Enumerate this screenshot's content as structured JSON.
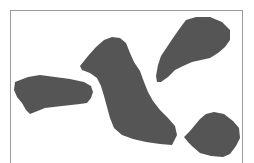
{
  "figure": {
    "frame": {
      "stroke": "#9a9a9a",
      "x": 10,
      "y": 10,
      "width": 233
    },
    "fill_color": "#555555",
    "background_color": "#ffffff",
    "blobs": [
      {
        "id": "left",
        "points": "15,82 28,77 40,75 55,77 70,79 84,82 91,86 93,92 91,98 87,103 80,104 62,106 45,108 30,114 26,110 22,103 17,97 14,90"
      },
      {
        "id": "center",
        "points": "80,66 88,56 96,47 104,40 112,37 120,38 126,43 130,53 134,62 140,71 144,82 148,92 153,101 160,110 168,118 175,126 177,135 172,145 160,144 146,142 133,139 122,135 114,128 110,118 107,107 104,96 101,86 97,78 90,73 82,70"
      },
      {
        "id": "upper-right",
        "points": "156,76 158,65 161,56 167,47 173,38 180,28 186,20 196,17 210,17 222,22 230,30 230,40 225,47 218,53 210,58 201,60 192,62 183,66 175,70 168,77 161,82 157,82"
      },
      {
        "id": "lower-right",
        "points": "184,137 190,131 195,125 200,119 206,114 214,112 224,114 233,121 239,128 240,138 236,146 230,154 223,157 211,156 200,153 193,147 188,142"
      }
    ]
  }
}
